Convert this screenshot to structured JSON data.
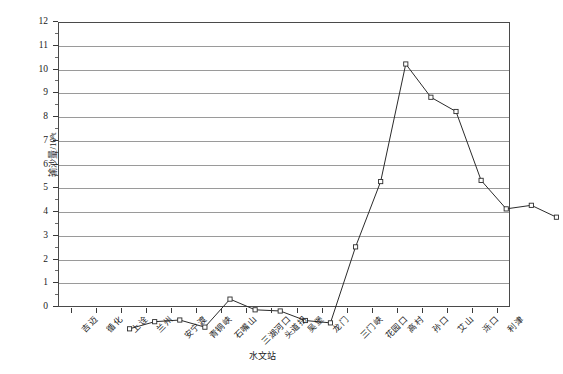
{
  "chart_data": {
    "type": "line",
    "title": "",
    "xlabel": "水文站",
    "ylabel": "输沙量/10⁸t",
    "ylim": [
      0,
      12
    ],
    "ytick_step": 1,
    "yminor_step": 0.5,
    "grid": true,
    "legend": "none",
    "marker": "open-square",
    "line_color": "#2b2b2b",
    "grid_color": "#9a9a9a",
    "categories": [
      "吉迈",
      "循化",
      "上诠",
      "兰州",
      "安宁渡",
      "青铜峡",
      "石嘴山",
      "三湖河口",
      "头道拐",
      "吴堡",
      "龙门",
      "三门峡",
      "花园口",
      "高村",
      "孙口",
      "艾山",
      "泺口",
      "利津"
    ],
    "values": [
      0.05,
      0.35,
      0.42,
      0.12,
      1.3,
      0.85,
      0.8,
      0.4,
      0.3,
      3.5,
      6.25,
      11.2,
      9.8,
      9.2,
      6.3,
      5.1,
      5.25,
      4.75
    ],
    "ytick_labels": [
      "0",
      "1",
      "2",
      "3",
      "4",
      "5",
      "6",
      "7",
      "8",
      "9",
      "10",
      "11",
      "12"
    ]
  }
}
